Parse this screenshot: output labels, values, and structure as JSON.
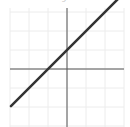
{
  "chart_data": {
    "type": "line",
    "title": "",
    "xlabel": "",
    "ylabel": "",
    "xlim": [
      -3,
      3
    ],
    "ylim": [
      -3,
      3
    ],
    "grid": true,
    "grid_step": 1,
    "series": [
      {
        "name": "y = x + 1",
        "x": [
          -3,
          3
        ],
        "y": [
          -2,
          4
        ],
        "color": "#333333"
      }
    ]
  },
  "colors": {
    "line": "#333333",
    "axis": "#555555",
    "grid": "#ececec"
  },
  "caption": "y"
}
